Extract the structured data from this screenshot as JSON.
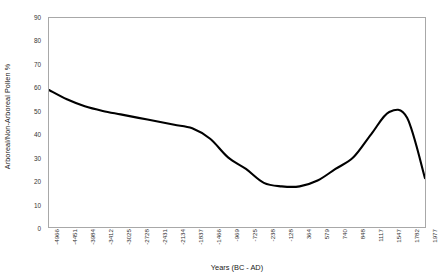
{
  "chart_data": {
    "type": "line",
    "title": "",
    "xlabel": "Years (BC - AD)",
    "ylabel": "Arboreal/Non-Arboreal Pollen %",
    "ylim": [
      0,
      90
    ],
    "ytick_labels": [
      "90",
      "80",
      "70",
      "60",
      "50",
      "40",
      "30",
      "20",
      "10",
      "0"
    ],
    "ytick_values": [
      90,
      80,
      70,
      60,
      50,
      40,
      30,
      20,
      10,
      0
    ],
    "grid": false,
    "legend": "none",
    "line_color": "#000000",
    "frame_color": "#a8a8a8",
    "background_color": "#ffffff",
    "xtick_labels": [
      "-4966",
      "-4451",
      "-3984",
      "-3412",
      "-3025",
      "-2728",
      "-2431",
      "-2134",
      "-1837",
      "-1466",
      "-969",
      "-725",
      "-238",
      "-128",
      "364",
      "579",
      "740",
      "848",
      "1117",
      "1547",
      "1782",
      "1977"
    ],
    "categories": [
      "-4966",
      "-4451",
      "-3984",
      "-3412",
      "-3025",
      "-2728",
      "-2431",
      "-2134",
      "-1837",
      "-1466",
      "-969",
      "-725",
      "-238",
      "-128",
      "364",
      "579",
      "740",
      "848",
      "1117",
      "1547",
      "1782",
      "1977"
    ],
    "values": [
      59,
      55,
      52,
      50,
      48.5,
      47,
      45.5,
      44,
      42.5,
      38,
      30,
      25,
      19,
      17.5,
      17.5,
      20,
      25,
      30,
      40,
      49.5,
      47,
      21
    ],
    "series": [
      {
        "name": "Arboreal/Non-Arboreal Pollen %",
        "values": [
          59,
          55,
          52,
          50,
          48.5,
          47,
          45.5,
          44,
          42.5,
          38,
          30,
          25,
          19,
          17.5,
          17.5,
          20,
          25,
          30,
          40,
          49.5,
          47,
          21
        ]
      }
    ],
    "annotations": []
  }
}
